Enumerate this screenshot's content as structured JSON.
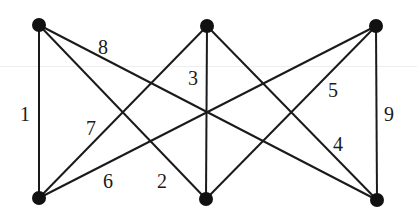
{
  "graph": {
    "nodes": [
      {
        "id": "TL",
        "x": 39,
        "y": 25
      },
      {
        "id": "TM",
        "x": 207,
        "y": 26
      },
      {
        "id": "TR",
        "x": 376,
        "y": 26
      },
      {
        "id": "BL",
        "x": 39,
        "y": 198
      },
      {
        "id": "BM",
        "x": 206,
        "y": 199
      },
      {
        "id": "BR",
        "x": 377,
        "y": 200
      }
    ],
    "edges": [
      {
        "from": "TL",
        "to": "BL",
        "label": "1",
        "lx": 20,
        "ly": 104
      },
      {
        "from": "TL",
        "to": "BM",
        "label": "2",
        "lx": 157,
        "ly": 171
      },
      {
        "from": "TM",
        "to": "BM",
        "label": "3",
        "lx": 188,
        "ly": 68
      },
      {
        "from": "TM",
        "to": "BR",
        "label": "4",
        "lx": 333,
        "ly": 134
      },
      {
        "from": "TR",
        "to": "BM",
        "label": "5",
        "lx": 328,
        "ly": 80
      },
      {
        "from": "TR",
        "to": "BL",
        "label": "6",
        "lx": 103,
        "ly": 171
      },
      {
        "from": "TM",
        "to": "BL",
        "label": "7",
        "lx": 86,
        "ly": 118
      },
      {
        "from": "TL",
        "to": "BR",
        "label": "8",
        "lx": 98,
        "ly": 37
      },
      {
        "from": "TR",
        "to": "BR",
        "label": "9",
        "lx": 384,
        "ly": 104
      }
    ]
  }
}
